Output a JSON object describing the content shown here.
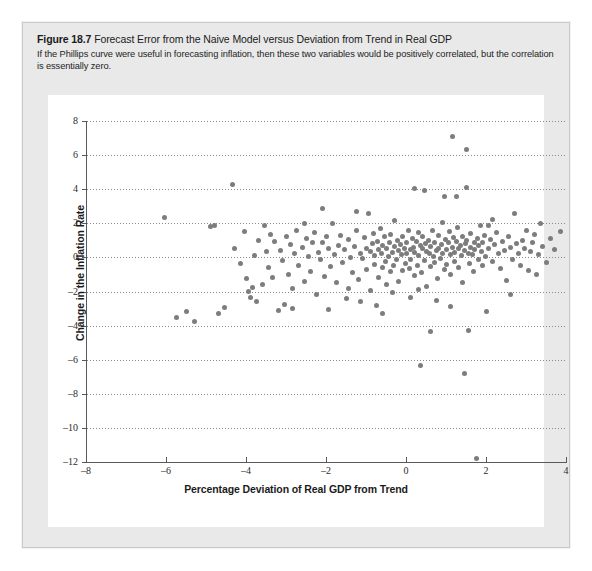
{
  "figure": {
    "number_label": "Figure 18.7",
    "title": "Forecast Error from the Naive Model versus Deviation from Trend in Real GDP",
    "description": "If the Phillips curve were useful in forecasting inflation, then these two variables would be positively correlated, but the correlation is essentially zero."
  },
  "colors": {
    "panel_background": "#e9e9e9",
    "plot_background": "#ffffff",
    "point_color": "#7d7d7d",
    "axis_color": "#58595b",
    "grid_color": "#8a8a8a",
    "text_color": "#1b1b1b"
  },
  "chart_data": {
    "type": "scatter",
    "title": "Forecast Error from the Naive Model versus Deviation from Trend in Real GDP",
    "xlabel": "Percentage Deviation of Real GDP from Trend",
    "ylabel": "Change in the Inflation Rate",
    "xlim": [
      -8,
      4
    ],
    "ylim": [
      -12,
      8
    ],
    "xticks": [
      -8,
      -6,
      -4,
      -2,
      0,
      2,
      4
    ],
    "xtick_labels": [
      "–8",
      "–6",
      "–4",
      "–2",
      "0",
      "2",
      "4"
    ],
    "yticks": [
      8,
      6,
      4,
      2,
      0,
      -2,
      -4,
      -6,
      -8,
      -10,
      -12
    ],
    "ytick_labels": [
      "8",
      "6",
      "4",
      "2",
      "0",
      "–2",
      "–4",
      "–6",
      "–8",
      "–10",
      "–12"
    ],
    "grid": "horizontal-dotted",
    "legend": null,
    "marker": "filled-circle",
    "points": [
      [
        -6.05,
        2.35
      ],
      [
        -5.75,
        -3.55
      ],
      [
        -5.5,
        -3.2
      ],
      [
        -5.3,
        -3.75
      ],
      [
        -4.9,
        1.8
      ],
      [
        -4.8,
        1.85
      ],
      [
        -4.35,
        4.3
      ],
      [
        -4.3,
        0.55
      ],
      [
        -4.15,
        -0.35
      ],
      [
        -4.05,
        1.5
      ],
      [
        -4.0,
        -1.25
      ],
      [
        -3.95,
        -2.0
      ],
      [
        -3.9,
        -2.35
      ],
      [
        -3.85,
        -1.75
      ],
      [
        -3.8,
        0.1
      ],
      [
        -3.75,
        -2.6
      ],
      [
        -3.7,
        1.0
      ],
      [
        -3.6,
        -1.6
      ],
      [
        -3.55,
        1.9
      ],
      [
        -3.5,
        0.35
      ],
      [
        -3.45,
        -0.6
      ],
      [
        -3.4,
        1.35
      ],
      [
        -3.35,
        -1.2
      ],
      [
        -3.3,
        0.95
      ],
      [
        -3.2,
        -3.1
      ],
      [
        -3.15,
        0.4
      ],
      [
        -3.1,
        -0.2
      ],
      [
        -3.0,
        1.2
      ],
      [
        -2.95,
        -1.0
      ],
      [
        -2.9,
        0.75
      ],
      [
        -2.85,
        -1.85
      ],
      [
        -2.8,
        0.25
      ],
      [
        -2.75,
        1.55
      ],
      [
        -2.7,
        -0.45
      ],
      [
        -2.6,
        0.6
      ],
      [
        -2.55,
        -1.4
      ],
      [
        -2.5,
        1.1
      ],
      [
        -2.45,
        0.05
      ],
      [
        -2.4,
        -0.8
      ],
      [
        -2.35,
        0.85
      ],
      [
        -2.3,
        1.45
      ],
      [
        -2.25,
        -2.2
      ],
      [
        -2.2,
        0.3
      ],
      [
        -2.15,
        -0.15
      ],
      [
        -2.1,
        0.9
      ],
      [
        -2.05,
        -1.1
      ],
      [
        -2.0,
        1.25
      ],
      [
        -1.95,
        0.5
      ],
      [
        -1.9,
        -0.55
      ],
      [
        -1.85,
        2.0
      ],
      [
        -1.8,
        0.15
      ],
      [
        -1.75,
        -1.5
      ],
      [
        -1.7,
        0.7
      ],
      [
        -1.65,
        1.3
      ],
      [
        -1.6,
        -0.3
      ],
      [
        -1.55,
        0.45
      ],
      [
        -1.5,
        -2.4
      ],
      [
        -1.45,
        1.05
      ],
      [
        -1.4,
        0.0
      ],
      [
        -1.35,
        -0.9
      ],
      [
        -1.3,
        0.65
      ],
      [
        -1.25,
        1.6
      ],
      [
        -1.2,
        -1.3
      ],
      [
        -1.15,
        0.2
      ],
      [
        -1.1,
        -0.05
      ],
      [
        -1.05,
        1.15
      ],
      [
        -1.0,
        0.55
      ],
      [
        -0.98,
        -0.7
      ],
      [
        -0.95,
        2.6
      ],
      [
        -0.9,
        0.35
      ],
      [
        -0.88,
        -1.95
      ],
      [
        -0.85,
        0.8
      ],
      [
        -0.82,
        1.4
      ],
      [
        -0.8,
        -0.4
      ],
      [
        -0.78,
        0.1
      ],
      [
        -0.75,
        -2.8
      ],
      [
        -0.72,
        0.95
      ],
      [
        -0.7,
        0.45
      ],
      [
        -0.68,
        -1.15
      ],
      [
        -0.65,
        1.7
      ],
      [
        -0.62,
        0.25
      ],
      [
        -0.6,
        -0.6
      ],
      [
        -0.58,
        0.7
      ],
      [
        -0.55,
        1.2
      ],
      [
        -0.52,
        -0.25
      ],
      [
        -0.5,
        0.5
      ],
      [
        -0.48,
        -1.6
      ],
      [
        -0.45,
        0.05
      ],
      [
        -0.42,
        0.9
      ],
      [
        -0.4,
        -0.85
      ],
      [
        -0.38,
        1.35
      ],
      [
        -0.35,
        0.3
      ],
      [
        -0.32,
        -0.5
      ],
      [
        -0.3,
        0.65
      ],
      [
        -0.28,
        2.15
      ],
      [
        -0.25,
        -0.1
      ],
      [
        -0.22,
        1.0
      ],
      [
        -0.2,
        0.4
      ],
      [
        -0.18,
        -1.4
      ],
      [
        -0.15,
        0.75
      ],
      [
        -0.12,
        0.15
      ],
      [
        -0.1,
        -0.75
      ],
      [
        -0.08,
        1.25
      ],
      [
        -0.05,
        0.55
      ],
      [
        -0.02,
        -0.35
      ],
      [
        0.0,
        0.85
      ],
      [
        0.02,
        0.2
      ],
      [
        0.05,
        1.55
      ],
      [
        0.08,
        -0.65
      ],
      [
        0.1,
        0.45
      ],
      [
        0.12,
        -0.15
      ],
      [
        0.15,
        1.1
      ],
      [
        0.18,
        0.6
      ],
      [
        0.2,
        -1.05
      ],
      [
        0.22,
        0.3
      ],
      [
        0.25,
        0.95
      ],
      [
        0.28,
        -0.45
      ],
      [
        0.3,
        1.45
      ],
      [
        0.32,
        0.1
      ],
      [
        0.35,
        0.7
      ],
      [
        0.38,
        -0.9
      ],
      [
        0.4,
        0.5
      ],
      [
        0.42,
        1.2
      ],
      [
        0.45,
        -0.2
      ],
      [
        0.48,
        0.8
      ],
      [
        0.5,
        0.35
      ],
      [
        0.52,
        -1.7
      ],
      [
        0.55,
        1.0
      ],
      [
        0.58,
        0.25
      ],
      [
        0.6,
        -0.55
      ],
      [
        0.62,
        0.65
      ],
      [
        0.65,
        1.6
      ],
      [
        0.68,
        0.05
      ],
      [
        0.7,
        -0.3
      ],
      [
        0.72,
        0.9
      ],
      [
        0.75,
        0.4
      ],
      [
        0.78,
        -1.25
      ],
      [
        0.8,
        1.3
      ],
      [
        0.82,
        0.55
      ],
      [
        0.85,
        -0.05
      ],
      [
        0.88,
        0.75
      ],
      [
        0.9,
        2.05
      ],
      [
        0.92,
        0.2
      ],
      [
        0.95,
        -0.7
      ],
      [
        0.98,
        1.05
      ],
      [
        1.0,
        0.45
      ],
      [
        1.02,
        -0.4
      ],
      [
        1.05,
        0.85
      ],
      [
        1.08,
        1.5
      ],
      [
        1.1,
        0.15
      ],
      [
        1.12,
        -1.0
      ],
      [
        1.15,
        0.6
      ],
      [
        1.15,
        7.1
      ],
      [
        1.18,
        1.15
      ],
      [
        1.2,
        0.3
      ],
      [
        1.22,
        -0.25
      ],
      [
        1.25,
        0.95
      ],
      [
        1.28,
        1.75
      ],
      [
        1.3,
        0.5
      ],
      [
        1.32,
        -0.6
      ],
      [
        1.35,
        0.7
      ],
      [
        1.38,
        0.1
      ],
      [
        1.4,
        1.25
      ],
      [
        1.42,
        -1.5
      ],
      [
        1.45,
        0.4
      ],
      [
        1.48,
        0.8
      ],
      [
        1.5,
        6.3
      ],
      [
        1.5,
        4.1
      ],
      [
        1.52,
        1.0
      ],
      [
        1.55,
        0.25
      ],
      [
        1.58,
        -0.35
      ],
      [
        1.6,
        0.6
      ],
      [
        1.62,
        1.4
      ],
      [
        1.65,
        0.15
      ],
      [
        1.68,
        -0.8
      ],
      [
        1.7,
        0.9
      ],
      [
        1.72,
        0.45
      ],
      [
        1.75,
        -11.8
      ],
      [
        1.78,
        1.1
      ],
      [
        1.8,
        -0.15
      ],
      [
        1.82,
        0.7
      ],
      [
        1.85,
        1.9
      ],
      [
        1.88,
        0.35
      ],
      [
        1.9,
        -0.5
      ],
      [
        1.92,
        0.85
      ],
      [
        1.95,
        1.3
      ],
      [
        1.98,
        0.05
      ],
      [
        2.0,
        -3.2
      ],
      [
        2.05,
        0.55
      ],
      [
        2.1,
        1.05
      ],
      [
        2.15,
        -0.25
      ],
      [
        2.2,
        0.75
      ],
      [
        2.25,
        1.45
      ],
      [
        2.3,
        0.2
      ],
      [
        2.35,
        -0.65
      ],
      [
        2.4,
        0.95
      ],
      [
        2.45,
        0.4
      ],
      [
        2.5,
        -1.35
      ],
      [
        2.55,
        1.2
      ],
      [
        2.6,
        0.6
      ],
      [
        2.65,
        -0.1
      ],
      [
        2.7,
        2.55
      ],
      [
        2.75,
        0.8
      ],
      [
        2.8,
        0.25
      ],
      [
        2.85,
        -0.45
      ],
      [
        2.9,
        1.0
      ],
      [
        2.95,
        0.5
      ],
      [
        3.0,
        1.6
      ],
      [
        3.05,
        -0.75
      ],
      [
        3.1,
        0.35
      ],
      [
        3.15,
        0.9
      ],
      [
        3.2,
        1.35
      ],
      [
        3.3,
        0.15
      ],
      [
        3.35,
        2.0
      ],
      [
        3.4,
        0.65
      ],
      [
        3.5,
        -0.3
      ],
      [
        3.6,
        1.1
      ],
      [
        3.7,
        0.45
      ],
      [
        3.85,
        1.5
      ],
      [
        0.35,
        -6.35
      ],
      [
        1.45,
        -6.8
      ],
      [
        0.6,
        -4.35
      ],
      [
        1.55,
        -4.3
      ],
      [
        0.2,
        4.05
      ],
      [
        0.45,
        3.95
      ],
      [
        -2.1,
        2.85
      ],
      [
        -2.55,
        2.0
      ],
      [
        -1.25,
        2.7
      ],
      [
        0.95,
        3.6
      ],
      [
        1.25,
        3.55
      ],
      [
        -4.55,
        -2.95
      ],
      [
        -4.7,
        -3.3
      ],
      [
        -3.05,
        -2.75
      ],
      [
        -2.85,
        -3.0
      ],
      [
        -1.95,
        -3.05
      ],
      [
        -1.15,
        -2.6
      ],
      [
        0.1,
        -2.35
      ],
      [
        0.75,
        -2.5
      ],
      [
        1.1,
        -2.9
      ],
      [
        2.6,
        -2.15
      ],
      [
        -0.6,
        -3.3
      ],
      [
        0.3,
        -1.9
      ],
      [
        2.05,
        1.85
      ],
      [
        2.15,
        2.2
      ],
      [
        -1.45,
        -1.85
      ],
      [
        -0.35,
        -2.05
      ],
      [
        3.25,
        -1.0
      ]
    ]
  }
}
